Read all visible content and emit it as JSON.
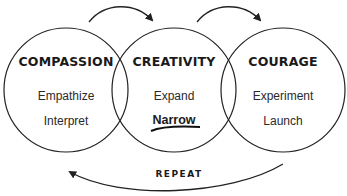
{
  "colors": {
    "stroke": "#222222",
    "text": "#1a1a1a",
    "background": "#ffffff"
  },
  "circles": [
    {
      "title": "COMPASSION",
      "items": [
        "Empathize",
        "Interpret"
      ]
    },
    {
      "title": "CREATIVITY",
      "items": [
        "Expand",
        "Narrow"
      ],
      "emphasized_item": "Narrow"
    },
    {
      "title": "COURAGE",
      "items": [
        "Experiment",
        "Launch"
      ]
    }
  ],
  "arrows": [
    {
      "from": "COMPASSION",
      "to": "CREATIVITY",
      "icon": "curved-arrow-icon"
    },
    {
      "from": "CREATIVITY",
      "to": "COURAGE",
      "icon": "curved-arrow-icon"
    },
    {
      "from": "COURAGE",
      "to": "COMPASSION",
      "label": "REPEAT",
      "icon": "return-arrow-icon"
    }
  ],
  "loop_label": "REPEAT"
}
